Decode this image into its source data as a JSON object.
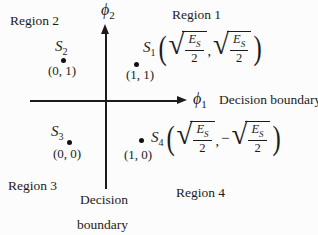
{
  "figure": {
    "background": "#fcfcfc",
    "ink": "#1b1b1b",
    "axes": {
      "x_label_base": "ϕ",
      "x_label_sub": "1",
      "y_label_base": "ϕ",
      "y_label_sub": "2"
    },
    "region_labels": {
      "r1": "Region 1",
      "r2": "Region 2",
      "r3": "Region 3",
      "r4": "Region 4"
    },
    "decision_boundary_right": "Decision boundary",
    "decision_boundary_bottom": {
      "line1": "Decision",
      "line2": "boundary"
    },
    "math": {
      "radical": "√",
      "energy_base": "E",
      "energy_sub": "S",
      "denominator": "2",
      "comma": ",",
      "minus": "−",
      "open_paren": "(",
      "close_paren": ")"
    },
    "points": {
      "s1": {
        "base": "S",
        "sub": "1",
        "bits": "(1, 1)"
      },
      "s2": {
        "base": "S",
        "sub": "2",
        "bits": "(0, 1)"
      },
      "s3": {
        "base": "S",
        "sub": "3",
        "bits": "(0, 0)"
      },
      "s4": {
        "base": "S",
        "sub": "4",
        "bits": "(1, 0)"
      }
    }
  }
}
